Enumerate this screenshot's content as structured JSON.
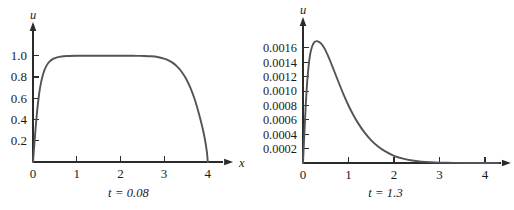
{
  "figure": {
    "background": "#ffffff",
    "curve_color": "#545458",
    "axis_color": "#2b2b2b",
    "panels": [
      "left",
      "right"
    ]
  },
  "chart_data": [
    {
      "type": "line",
      "panel": "left",
      "title": "",
      "caption": "t = 0.08",
      "xlabel": "x",
      "ylabel": "u",
      "xlim": [
        0,
        4.35
      ],
      "ylim": [
        0,
        1.12
      ],
      "xticks": [
        0,
        1,
        2,
        3,
        4
      ],
      "xticklabels": [
        "0",
        "1",
        "2",
        "3",
        "4"
      ],
      "yticks": [
        0.2,
        0.4,
        0.6,
        0.8,
        1.0
      ],
      "yticklabels": [
        "0.2",
        "0.4",
        "0.6",
        "0.8",
        "1.0"
      ],
      "grid": false,
      "legend": null,
      "series": [
        {
          "name": "u(x, 0.08)",
          "x": [
            0.0,
            0.03,
            0.06,
            0.1,
            0.14,
            0.18,
            0.22,
            0.26,
            0.3,
            0.35,
            0.4,
            0.45,
            0.5,
            0.55,
            0.6,
            0.7,
            0.8,
            1.0,
            1.2,
            1.5,
            1.8,
            2.0,
            2.2,
            2.4,
            2.55,
            2.7,
            2.85,
            3.0,
            3.1,
            3.2,
            3.3,
            3.4,
            3.5,
            3.6,
            3.7,
            3.8,
            3.88,
            3.94,
            3.98,
            4.0
          ],
          "y": [
            0.0,
            0.16,
            0.32,
            0.5,
            0.64,
            0.74,
            0.81,
            0.862,
            0.9,
            0.932,
            0.953,
            0.968,
            0.978,
            0.985,
            0.99,
            0.996,
            0.998,
            1.0,
            1.0,
            1.0,
            1.0,
            1.0,
            1.0,
            0.999,
            0.998,
            0.995,
            0.988,
            0.973,
            0.957,
            0.933,
            0.898,
            0.85,
            0.786,
            0.7,
            0.59,
            0.45,
            0.32,
            0.2,
            0.09,
            0.0
          ]
        }
      ]
    },
    {
      "type": "line",
      "panel": "right",
      "title": "",
      "caption": "t = 1.3",
      "xlabel": "x",
      "ylabel": "u",
      "xlim": [
        0,
        4.35
      ],
      "ylim": [
        0,
        0.00178
      ],
      "xticks": [
        0,
        1,
        2,
        3,
        4
      ],
      "xticklabels": [
        "0",
        "1",
        "2",
        "3",
        "4"
      ],
      "yticks": [
        0.0002,
        0.0004,
        0.0006,
        0.0008,
        0.001,
        0.0012,
        0.0014,
        0.0016
      ],
      "yticklabels": [
        "0.0002",
        "0.0004",
        "0.0006",
        "0.0008",
        "0.0010",
        "0.0012",
        "0.0014",
        "0.0016"
      ],
      "grid": false,
      "legend": null,
      "series": [
        {
          "name": "u(x, 1.3)",
          "x": [
            0.0,
            0.04,
            0.08,
            0.12,
            0.16,
            0.2,
            0.25,
            0.3,
            0.35,
            0.4,
            0.45,
            0.5,
            0.55,
            0.6,
            0.7,
            0.8,
            0.9,
            1.0,
            1.1,
            1.2,
            1.35,
            1.5,
            1.65,
            1.8,
            2.0,
            2.2,
            2.4,
            2.6,
            2.8,
            3.0,
            3.3,
            3.6,
            4.0,
            4.3
          ],
          "y": [
            0.0,
            0.00054,
            0.00102,
            0.00133,
            0.00152,
            0.00162,
            0.00168,
            0.001695,
            0.001685,
            0.00166,
            0.001615,
            0.00156,
            0.00149,
            0.001415,
            0.001255,
            0.001095,
            0.00094,
            0.0008,
            0.000675,
            0.000565,
            0.000425,
            0.000315,
            0.00023,
            0.000165,
            0.0001,
            6e-05,
            3.4e-05,
            1.9e-05,
            1e-05,
            5.5e-06,
            2e-06,
            8e-07,
            2e-07,
            1e-07
          ]
        }
      ]
    }
  ],
  "left": {
    "ylabel": "u",
    "xlabel": "x",
    "caption": "t = 0.08",
    "yticklabels": [
      "1.0",
      "0.8",
      "0.6",
      "0.4",
      "0.2"
    ],
    "xticklabels": [
      "0",
      "1",
      "2",
      "3",
      "4"
    ]
  },
  "right": {
    "ylabel": "u",
    "xlabel": "x",
    "caption": "t = 1.3",
    "yticklabels": [
      "0.0016",
      "0.0014",
      "0.0012",
      "0.0010",
      "0.0008",
      "0.0006",
      "0.0004",
      "0.0002"
    ],
    "xticklabels": [
      "0",
      "1",
      "2",
      "3",
      "4"
    ]
  }
}
